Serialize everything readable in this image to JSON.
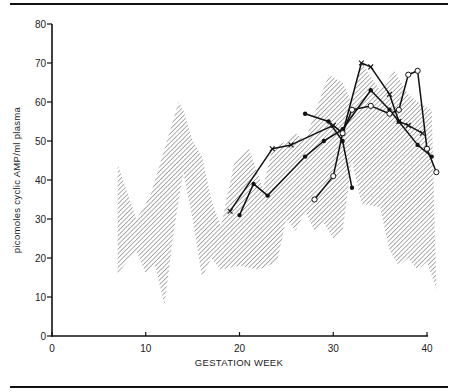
{
  "chart_data": {
    "type": "line",
    "title": "",
    "xlabel": "GESTATION WEEK",
    "ylabel": "picomoles cyclic AMP/ml plasma",
    "xlim": [
      0,
      40
    ],
    "ylim": [
      0,
      80
    ],
    "xticks": [
      0,
      10,
      20,
      30,
      40
    ],
    "yticks": [
      0,
      10,
      20,
      30,
      40,
      50,
      60,
      70,
      80
    ],
    "grid": false,
    "legend": null,
    "band": {
      "name": "normal range (hatched)",
      "upper": [
        [
          7,
          44
        ],
        [
          9,
          30
        ],
        [
          10.5,
          36
        ],
        [
          12,
          48
        ],
        [
          13.5,
          60
        ],
        [
          14,
          58
        ],
        [
          15,
          50
        ],
        [
          16,
          46
        ],
        [
          17,
          35
        ],
        [
          18,
          28
        ],
        [
          19.5,
          45
        ],
        [
          21,
          48
        ],
        [
          22.5,
          38
        ],
        [
          23.5,
          48
        ],
        [
          25,
          50
        ],
        [
          26,
          52
        ],
        [
          27,
          50
        ],
        [
          28,
          57
        ],
        [
          29.5,
          67
        ],
        [
          31,
          65
        ],
        [
          32,
          60
        ],
        [
          33,
          70
        ],
        [
          35,
          63
        ],
        [
          36.5,
          68
        ],
        [
          38,
          62
        ],
        [
          39,
          60
        ],
        [
          40.5,
          58
        ]
      ],
      "lower": [
        [
          7,
          16
        ],
        [
          9,
          22
        ],
        [
          10,
          16
        ],
        [
          11,
          18
        ],
        [
          12,
          8
        ],
        [
          13,
          27
        ],
        [
          14,
          42
        ],
        [
          15,
          30
        ],
        [
          16,
          15
        ],
        [
          17,
          20
        ],
        [
          18,
          17
        ],
        [
          20,
          18
        ],
        [
          22,
          17
        ],
        [
          24,
          19
        ],
        [
          25,
          30
        ],
        [
          26,
          27
        ],
        [
          27,
          32
        ],
        [
          28,
          27
        ],
        [
          29,
          29
        ],
        [
          30,
          25
        ],
        [
          31,
          27
        ],
        [
          32,
          45
        ],
        [
          33,
          34
        ],
        [
          35,
          33
        ],
        [
          36,
          22
        ],
        [
          37,
          18
        ],
        [
          38,
          20
        ],
        [
          39,
          17
        ],
        [
          40,
          19
        ],
        [
          41,
          12
        ]
      ]
    },
    "series": [
      {
        "name": "patient 1",
        "marker": "cross",
        "x": [
          19,
          23.5,
          25.5,
          30,
          31,
          33,
          34,
          36,
          37,
          38,
          39.5
        ],
        "values": [
          32,
          48,
          49,
          54,
          52,
          70,
          69,
          62,
          55,
          54,
          52
        ]
      },
      {
        "name": "patient 2",
        "marker": "filled-dot",
        "x": [
          20,
          21.5,
          23,
          27,
          29,
          31,
          34,
          36,
          37,
          39,
          40.5
        ],
        "values": [
          31,
          39,
          36,
          46,
          50,
          53,
          63,
          58,
          55,
          49,
          46
        ]
      },
      {
        "name": "patient 3",
        "marker": "filled-dot",
        "x": [
          27,
          29.5,
          31,
          32
        ],
        "values": [
          57,
          55,
          50,
          38
        ]
      },
      {
        "name": "patient 4",
        "marker": "open-circle",
        "x": [
          28,
          30,
          31,
          32,
          34,
          36,
          37,
          38,
          39,
          40,
          41
        ],
        "values": [
          35,
          41,
          52,
          58,
          59,
          57,
          58,
          67,
          68,
          48,
          42
        ]
      }
    ]
  },
  "axes": {
    "x_title": "GESTATION WEEK",
    "y_title": "picomoles cyclic AMP/ml plasma",
    "x_tick_labels": [
      "0",
      "10",
      "20",
      "30",
      "40"
    ],
    "y_tick_labels": [
      "0",
      "10",
      "20",
      "30",
      "40",
      "50",
      "60",
      "70",
      "80"
    ]
  }
}
